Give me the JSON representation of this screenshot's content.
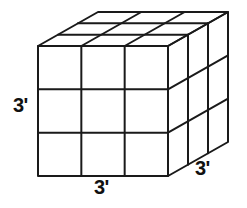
{
  "figure": {
    "kind": "geometry-diagram",
    "shape_name": "cube",
    "background_color": "#ffffff",
    "stroke_color": "#1a1a1a",
    "face_fill_color": "#ffffff",
    "stroke_width_px": 2,
    "divisions_per_edge": 3
  },
  "labels": {
    "height": "3'",
    "width": "3'",
    "depth": "3'"
  },
  "geometry": {
    "front_face": {
      "left_x": 38,
      "right_x": 168,
      "top_y": 46,
      "bottom_y": 176
    },
    "depth_offset": {
      "dx": 60,
      "dy": -34
    },
    "front_vertical_grid_x": [
      81,
      124
    ],
    "front_horizontal_grid_y": [
      89,
      133
    ]
  }
}
